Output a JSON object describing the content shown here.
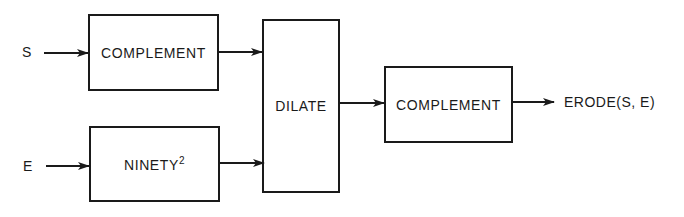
{
  "inputs": {
    "s": "S",
    "e": "E"
  },
  "blocks": {
    "complement_top": "COMPLEMENT",
    "ninety": "NINETY",
    "ninety_superscript": "2",
    "dilate": "DILATE",
    "complement_out": "COMPLEMENT"
  },
  "output": {
    "label": "ERODE(S, E)"
  },
  "colors": {
    "stroke": "#1a1a1a",
    "background": "#ffffff"
  }
}
